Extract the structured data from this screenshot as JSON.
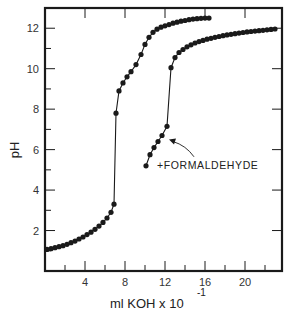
{
  "chart_data": {
    "type": "line",
    "title": "",
    "xlabel": "ml  KOH x 10",
    "xlabel_exponent": "-1",
    "ylabel": "pH",
    "xlim": [
      0,
      23.7
    ],
    "ylim": [
      0,
      13
    ],
    "x_ticks": [
      4,
      8,
      12,
      16,
      20
    ],
    "x_minor_ticks": [
      2,
      6,
      10,
      14,
      18,
      22
    ],
    "y_ticks": [
      2,
      4,
      6,
      8,
      10,
      12
    ],
    "y_minor_ticks": [
      1,
      3,
      5,
      7,
      9,
      11
    ],
    "grid": false,
    "legend": null,
    "annotations": [
      {
        "text": "+ FORMALDEHYDE",
        "x": 14.4,
        "y": 5.2,
        "arrow_to": [
          12.4,
          6.5
        ]
      }
    ],
    "series": [
      {
        "name": "Titration (no formaldehyde)",
        "marker": "filled-circle",
        "points": [
          [
            0.2,
            1.07
          ],
          [
            0.6,
            1.1
          ],
          [
            1.0,
            1.15
          ],
          [
            1.4,
            1.2
          ],
          [
            1.8,
            1.25
          ],
          [
            2.2,
            1.32
          ],
          [
            2.6,
            1.4
          ],
          [
            3.0,
            1.48
          ],
          [
            3.4,
            1.58
          ],
          [
            3.8,
            1.68
          ],
          [
            4.2,
            1.8
          ],
          [
            4.6,
            1.92
          ],
          [
            5.0,
            2.06
          ],
          [
            5.4,
            2.22
          ],
          [
            5.8,
            2.4
          ],
          [
            6.2,
            2.62
          ],
          [
            6.6,
            2.9
          ],
          [
            6.9,
            3.3
          ],
          [
            7.1,
            7.8
          ],
          [
            7.4,
            8.9
          ],
          [
            7.8,
            9.3
          ],
          [
            8.2,
            9.6
          ],
          [
            8.6,
            9.85
          ],
          [
            9.1,
            10.2
          ],
          [
            9.6,
            10.7
          ],
          [
            10.0,
            11.2
          ],
          [
            10.4,
            11.55
          ],
          [
            10.8,
            11.8
          ],
          [
            11.2,
            11.95
          ],
          [
            11.6,
            12.05
          ],
          [
            12.0,
            12.12
          ],
          [
            12.4,
            12.18
          ],
          [
            12.8,
            12.25
          ],
          [
            13.2,
            12.3
          ],
          [
            13.6,
            12.35
          ],
          [
            14.0,
            12.38
          ],
          [
            14.4,
            12.42
          ],
          [
            14.8,
            12.45
          ],
          [
            15.2,
            12.47
          ],
          [
            15.6,
            12.49
          ],
          [
            16.0,
            12.5
          ],
          [
            16.4,
            12.5
          ]
        ]
      },
      {
        "name": "+ Formaldehyde",
        "marker": "filled-circle",
        "points": [
          [
            10.1,
            5.2
          ],
          [
            10.5,
            5.75
          ],
          [
            10.9,
            6.1
          ],
          [
            11.3,
            6.4
          ],
          [
            11.7,
            6.7
          ],
          [
            12.2,
            7.15
          ],
          [
            12.6,
            10.05
          ],
          [
            13.0,
            10.55
          ],
          [
            13.4,
            10.8
          ],
          [
            13.8,
            10.95
          ],
          [
            14.2,
            11.08
          ],
          [
            14.6,
            11.18
          ],
          [
            15.0,
            11.27
          ],
          [
            15.4,
            11.34
          ],
          [
            15.8,
            11.4
          ],
          [
            16.2,
            11.46
          ],
          [
            16.6,
            11.5
          ],
          [
            17.0,
            11.55
          ],
          [
            17.4,
            11.59
          ],
          [
            17.8,
            11.63
          ],
          [
            18.2,
            11.67
          ],
          [
            18.6,
            11.7
          ],
          [
            19.0,
            11.73
          ],
          [
            19.4,
            11.76
          ],
          [
            19.8,
            11.79
          ],
          [
            20.2,
            11.82
          ],
          [
            20.6,
            11.84
          ],
          [
            21.0,
            11.86
          ],
          [
            21.4,
            11.88
          ],
          [
            21.8,
            11.9
          ],
          [
            22.2,
            11.92
          ],
          [
            22.6,
            11.94
          ],
          [
            23.0,
            11.96
          ]
        ]
      }
    ]
  },
  "labels": {
    "ylabel": "pH",
    "xlabel": "ml  KOH x 10",
    "xlabel_exponent": "-1",
    "annotation": "+FORMALDEHYDE"
  },
  "colors": {
    "ink": "#1a1a1a",
    "background": "#ffffff"
  }
}
